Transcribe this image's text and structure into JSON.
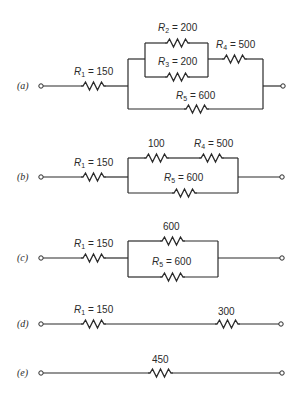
{
  "figure": {
    "colors": {
      "line": "#2a2a2a",
      "background": "#ffffff"
    }
  },
  "circuits": [
    {
      "id": "a",
      "label": "(a)",
      "resistors": [
        {
          "name": "R",
          "sub": "1",
          "value": "150",
          "eq": " = ",
          "full": "R1 = 150"
        },
        {
          "name": "R",
          "sub": "2",
          "value": "200",
          "eq": " = ",
          "full": "R2 = 200"
        },
        {
          "name": "R",
          "sub": "3",
          "value": "200",
          "eq": " = ",
          "full": "R3 = 200"
        },
        {
          "name": "R",
          "sub": "4",
          "value": "500",
          "eq": " = ",
          "full": "R4 = 500"
        },
        {
          "name": "R",
          "sub": "5",
          "value": "600",
          "eq": " = ",
          "full": "R5 = 600"
        }
      ]
    },
    {
      "id": "b",
      "label": "(b)",
      "resistors": [
        {
          "name": "R",
          "sub": "1",
          "value": "150",
          "eq": " = ",
          "full": "R1 = 150"
        },
        {
          "name": "",
          "sub": "",
          "value": "100",
          "eq": "",
          "full": "100"
        },
        {
          "name": "R",
          "sub": "4",
          "value": "500",
          "eq": " = ",
          "full": "R4 = 500"
        },
        {
          "name": "R",
          "sub": "5",
          "value": "600",
          "eq": " = ",
          "full": "R5 = 600"
        }
      ]
    },
    {
      "id": "c",
      "label": "(c)",
      "resistors": [
        {
          "name": "R",
          "sub": "1",
          "value": "150",
          "eq": " = ",
          "full": "R1 = 150"
        },
        {
          "name": "",
          "sub": "",
          "value": "600",
          "eq": "",
          "full": "600"
        },
        {
          "name": "R",
          "sub": "5",
          "value": "600",
          "eq": " = ",
          "full": "R5 = 600"
        }
      ]
    },
    {
      "id": "d",
      "label": "(d)",
      "resistors": [
        {
          "name": "R",
          "sub": "1",
          "value": "150",
          "eq": " = ",
          "full": "R1 = 150"
        },
        {
          "name": "",
          "sub": "",
          "value": "300",
          "eq": "",
          "full": "300"
        }
      ]
    },
    {
      "id": "e",
      "label": "(e)",
      "resistors": [
        {
          "name": "",
          "sub": "",
          "value": "450",
          "eq": "",
          "full": "450"
        }
      ]
    }
  ]
}
